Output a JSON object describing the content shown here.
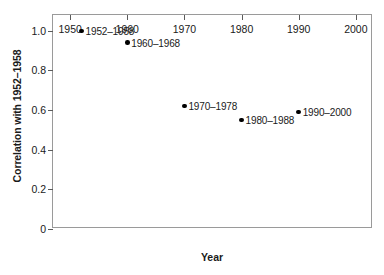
{
  "chart_data": {
    "type": "scatter",
    "title": "",
    "xlabel": "Year",
    "ylabel": "Correlation with 1952–1958",
    "xlim": [
      1947,
      2003
    ],
    "ylim": [
      0,
      1.08
    ],
    "grid": false,
    "legend": "none",
    "xticks": [
      "1950",
      "1960",
      "1970",
      "1980",
      "1990",
      "2000"
    ],
    "xtick_values": [
      1950,
      1960,
      1970,
      1980,
      1990,
      2000
    ],
    "yticks": [
      "0",
      "0.2",
      "0.4",
      "0.6",
      "0.8",
      "1.0"
    ],
    "ytick_values": [
      0,
      0.2,
      0.4,
      0.6,
      0.8,
      1.0
    ],
    "x": [
      1952,
      1960,
      1970,
      1980,
      1990
    ],
    "values": [
      1.0,
      0.94,
      0.62,
      0.55,
      0.59
    ],
    "point_labels": [
      "1952–1958",
      "1960–1968",
      "1970–1978",
      "1980–1988",
      "1990–2000"
    ],
    "points": [
      {
        "x": 1952,
        "y": 1.0,
        "label": "1952–1958"
      },
      {
        "x": 1960,
        "y": 0.94,
        "label": "1960–1968"
      },
      {
        "x": 1970,
        "y": 0.62,
        "label": "1970–1978"
      },
      {
        "x": 1980,
        "y": 0.55,
        "label": "1980–1988"
      },
      {
        "x": 1990,
        "y": 0.59,
        "label": "1990–2000"
      }
    ],
    "marker_color": "#000000",
    "frame_color": "#9a9a9a",
    "background": "#ffffff"
  }
}
